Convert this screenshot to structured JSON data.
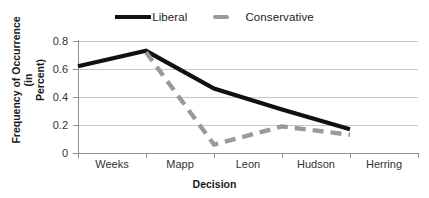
{
  "chart_data": {
    "type": "line",
    "title": "",
    "xlabel": "Decision",
    "ylabel": "Frequency of Occurrence (in Percent)",
    "ylabel_line1": "Frequency of Occurrence (in",
    "ylabel_line2": "Percent)",
    "categories": [
      "Weeks",
      "Mapp",
      "Leon",
      "Hudson",
      "Herring"
    ],
    "ylim": [
      0,
      0.8
    ],
    "yticks": [
      "0",
      "0.2",
      "0.4",
      "0.6",
      "0.8"
    ],
    "ytick_values": [
      0,
      0.2,
      0.4,
      0.6,
      0.8
    ],
    "grid": "horizontal",
    "legend_position": "top-center",
    "series": [
      {
        "name": "Liberal",
        "style": "solid",
        "color": "#111111",
        "values": [
          0.62,
          0.73,
          0.46,
          0.31,
          0.17
        ]
      },
      {
        "name": "Conservative",
        "style": "dashed",
        "color": "#9A9A9A",
        "values": [
          null,
          0.72,
          0.06,
          0.19,
          0.13
        ]
      }
    ]
  },
  "legend": {
    "entries": [
      {
        "label": "Liberal",
        "swatch": "solid-line-swatch"
      },
      {
        "label": "Conservative",
        "swatch": "dashed-line-swatch"
      }
    ]
  }
}
